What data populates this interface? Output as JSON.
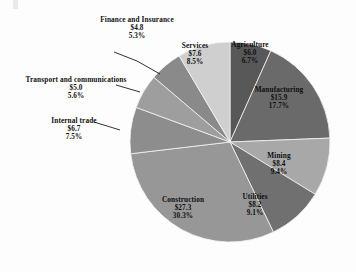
{
  "chart_data": {
    "type": "pie",
    "title": "",
    "subtitle": "",
    "xlabel": "",
    "ylabel": "",
    "legend": "none",
    "grid": false,
    "value_prefix": "$",
    "start_angle_deg": 0,
    "direction": "clockwise",
    "categories": [
      "Agriculture",
      "Manufacturing",
      "Mining",
      "Utilities",
      "Construction",
      "Internal trade",
      "Transport and communications",
      "Finance and Insurance",
      "Services"
    ],
    "values": [
      6.0,
      15.9,
      8.4,
      8.2,
      27.3,
      6.7,
      5.0,
      4.8,
      7.6
    ],
    "percents": [
      6.7,
      17.7,
      9.4,
      9.1,
      30.3,
      7.5,
      5.6,
      5.3,
      8.5
    ],
    "colors": [
      "#585858",
      "#6a6a6a",
      "#a8a8a8",
      "#707070",
      "#979797",
      "#8d8d8d",
      "#9e9e9e",
      "#8a8a8a",
      "#cfcfcf"
    ]
  },
  "slices": {
    "agriculture": {
      "name": "Agriculture",
      "value": "$6.0",
      "percent": "6.7%"
    },
    "manufacturing": {
      "name": "Manufacturing",
      "value": "$15.9",
      "percent": "17.7%"
    },
    "mining": {
      "name": "Mining",
      "value": "$8.4",
      "percent": "9.4%"
    },
    "utilities": {
      "name": "Utilities",
      "value": "$8.2",
      "percent": "9.1%"
    },
    "construction": {
      "name": "Construction",
      "value": "$27.3",
      "percent": "30.3%"
    },
    "internal": {
      "name": "Internal trade",
      "value": "$6.7",
      "percent": "7.5%"
    },
    "transport": {
      "name": "Transport and communications",
      "value": "$5.0",
      "percent": "5.6%"
    },
    "finance": {
      "name": "Finance and Insurance",
      "value": "$4.8",
      "percent": "5.3%"
    },
    "services": {
      "name": "Services",
      "value": "$7.6",
      "percent": "8.5%"
    }
  }
}
